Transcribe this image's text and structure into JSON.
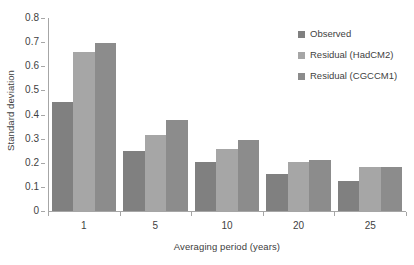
{
  "chart_data": {
    "type": "bar",
    "title": "",
    "subtitle": "",
    "xlabel": "Averaging period (years)",
    "ylabel": "Standard deviation",
    "categories": [
      "1",
      "5",
      "10",
      "20",
      "25"
    ],
    "series": [
      {
        "name": "Observed",
        "color": "#808080",
        "values": [
          0.45,
          0.247,
          0.205,
          0.153,
          0.124
        ]
      },
      {
        "name": "Residual (HadCM2)",
        "color": "#a6a6a6",
        "values": [
          0.658,
          0.317,
          0.257,
          0.204,
          0.181
        ]
      },
      {
        "name": "Residual (CGCCM1)",
        "color": "#8c8c8c",
        "values": [
          0.698,
          0.377,
          0.296,
          0.212,
          0.181
        ]
      }
    ],
    "ylim": [
      0,
      0.8
    ],
    "ytick_values": [
      0,
      0.1,
      0.2,
      0.3,
      0.4,
      0.5,
      0.6,
      0.7,
      0.8
    ],
    "ytick_labels": [
      "0",
      "0.1",
      "0.2",
      "0.3",
      "0.4",
      "0.5",
      "0.6",
      "0.7",
      "0.8"
    ],
    "grid": false,
    "legend_position": "top-right"
  },
  "legend": {
    "entries": [
      {
        "label": "Observed",
        "color": "#808080"
      },
      {
        "label": "Residual (HadCM2)",
        "color": "#a6a6a6"
      },
      {
        "label": "Residual (CGCCM1)",
        "color": "#8c8c8c"
      }
    ]
  },
  "colors": {
    "axis": "#a6a6a6",
    "text": "#3f3f3f",
    "background": "#ffffff"
  }
}
